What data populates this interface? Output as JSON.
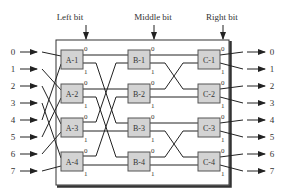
{
  "diagram": {
    "headers": [
      {
        "label": "Left bit",
        "x": 70
      },
      {
        "label": "Middle bit",
        "x": 153
      },
      {
        "label": "Right bit",
        "x": 222
      }
    ],
    "inputs": [
      "0",
      "1",
      "2",
      "3",
      "4",
      "5",
      "6",
      "7"
    ],
    "outputs": [
      "0",
      "1",
      "2",
      "3",
      "4",
      "5",
      "6",
      "7"
    ],
    "stages": [
      {
        "name": "A",
        "switches": [
          "A-1",
          "A-2",
          "A-3",
          "A-4"
        ]
      },
      {
        "name": "B",
        "switches": [
          "B-1",
          "B-2",
          "B-3",
          "B-4"
        ]
      },
      {
        "name": "C",
        "switches": [
          "C-1",
          "C-2",
          "C-3",
          "C-4"
        ]
      }
    ],
    "port_labels": {
      "upper": "0",
      "lower": "1"
    },
    "colors": {
      "switch_fill": "#d3d3d3",
      "wire": "#222222",
      "background": "#ffffff"
    }
  }
}
